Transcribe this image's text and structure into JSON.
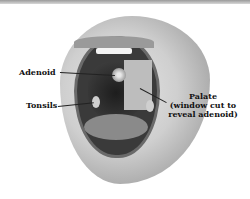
{
  "figure": {
    "labels": {
      "adenoid": "Adenoid",
      "tonsils": "Tonsils",
      "palate_line1": "Palate",
      "palate_line2": "(window cut to",
      "palate_line3": "reveal adenoid)"
    }
  }
}
